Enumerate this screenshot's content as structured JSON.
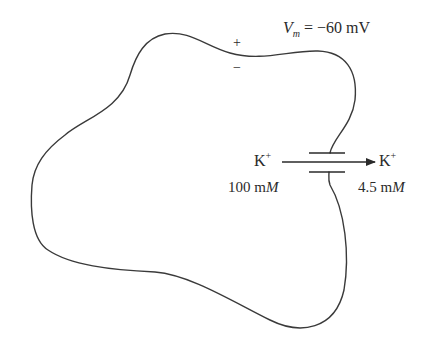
{
  "diagram": {
    "type": "cell membrane potential schematic",
    "membrane_potential": {
      "symbol": "V",
      "subscript": "m",
      "equals": "= −60 mV"
    },
    "charge_signs": {
      "outside": "+",
      "inside": "−"
    },
    "ion_left": {
      "symbol": "K",
      "charge": "+",
      "concentration_value": "100 m",
      "concentration_unit": "M"
    },
    "ion_right": {
      "symbol": "K",
      "charge": "+",
      "concentration_value": "4.5 m",
      "concentration_unit": "M"
    },
    "channel": "potassium channel (two parallel plates)",
    "flux_direction": "left-to-right (inside to outside)",
    "colors": {
      "line": "#3a3a3a",
      "text": "#2a2a2a",
      "background": "#ffffff"
    }
  }
}
